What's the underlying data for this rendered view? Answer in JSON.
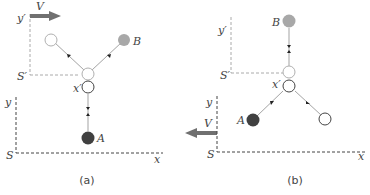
{
  "colors": {
    "ink": "#444444",
    "axis_frame": "#444444",
    "moving_frame": "#aaaaaa",
    "arrow_V": "#707070",
    "particle_A": "#404040",
    "particle_B": "#a8a8a8",
    "open_circle_light": "#b0b0b0",
    "open_circle_dark": "#444444",
    "track": "#999999"
  },
  "panels": [
    {
      "caption": "(a)",
      "labels": {
        "y_prime": "y′",
        "s_prime": "S′",
        "x_prime": "x′",
        "y": "y",
        "s": "S",
        "x": "x",
        "v": "V",
        "a": "A",
        "b": "B"
      },
      "velocity_direction": "right"
    },
    {
      "caption": "(b)",
      "labels": {
        "y_prime": "y′",
        "s_prime": "S′",
        "x_prime": "x′",
        "y": "y",
        "s": "S",
        "x": "x",
        "v": "V",
        "a": "A",
        "b": "B"
      },
      "velocity_direction": "left"
    }
  ]
}
